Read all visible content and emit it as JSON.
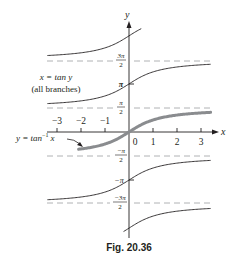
{
  "chart_data": {
    "type": "line",
    "title": "",
    "caption": "Fig. 20.36",
    "xlabel": "x",
    "ylabel": "y",
    "x_ticks": [
      -3,
      -2,
      -1,
      0,
      1,
      2,
      3
    ],
    "x_tick_labels": [
      "−3",
      "−2",
      "−1",
      "0",
      "1",
      "2",
      "3"
    ],
    "y_tick_labels": [
      "3π/2",
      "π",
      "π/2",
      "−π/2",
      "−π",
      "−3π/2"
    ],
    "xlim": [
      -3.4,
      3.4
    ],
    "ylim": [
      -7.5,
      8.0
    ],
    "grid": false,
    "asymptotes": [
      {
        "y": "3π/2",
        "value": 4.712,
        "style": "dashed"
      },
      {
        "y": "π/2",
        "value": 1.571,
        "style": "dashed"
      },
      {
        "y": "−π/2",
        "value": -1.571,
        "style": "dashed"
      },
      {
        "y": "−3π/2",
        "value": -4.712,
        "style": "dashed"
      }
    ],
    "series": [
      {
        "name": "x = tan y (all branches)",
        "function": "y = tan^-1 x + kπ",
        "branches_k": [
          -2,
          -1,
          1,
          2
        ],
        "style": "thin"
      },
      {
        "name": "y = tan^-1 x",
        "function": "y = arctan(x)",
        "branches_k": [
          0
        ],
        "style": "thick"
      }
    ],
    "annotations": [
      {
        "text": "x = tan y",
        "line2": "(all branches)"
      },
      {
        "text": "y = tan⁻¹ x",
        "arrow": true
      }
    ]
  },
  "labels": {
    "x_axis": "x",
    "y_axis": "y",
    "ticks": [
      "−3",
      "−2",
      "−1",
      "0",
      "1",
      "2",
      "3"
    ],
    "three_pi_over_2_num": "3π",
    "pi_over_2_num": "π",
    "neg_pi_over_2_num": "−π",
    "neg_three_pi_over_2_num": "−3π",
    "den": "2",
    "pi": "π",
    "neg_pi": "−π",
    "branches_line1": "x = tan y",
    "branches_line2": "(all branches)",
    "arctan_label_y": "y = tan",
    "arctan_label_sup": "−1",
    "arctan_label_x": "x",
    "caption": "Fig. 20.36"
  }
}
